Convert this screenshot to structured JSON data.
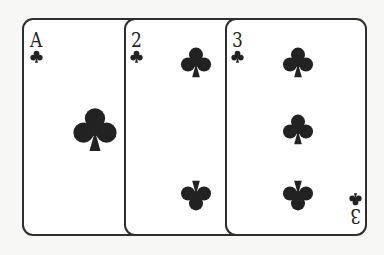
{
  "scene": {
    "description": "Three playing cards of the clubs suit fanned left to right",
    "background_color": "#f7f7f5",
    "ink_color": "#222222"
  },
  "cards": [
    {
      "rank": "A",
      "suit": "clubs",
      "suit_symbol": "club-icon",
      "pips": 1
    },
    {
      "rank": "2",
      "suit": "clubs",
      "suit_symbol": "club-icon",
      "pips": 2
    },
    {
      "rank": "3",
      "suit": "clubs",
      "suit_symbol": "club-icon",
      "pips": 3
    }
  ]
}
